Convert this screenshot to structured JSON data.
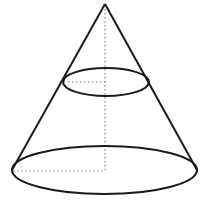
{
  "diagram": {
    "type": "geometry",
    "stroke_color": "#1a1a1a",
    "dotted_color": "#888888",
    "background": "#ffffff",
    "apex": {
      "x": 105,
      "y": 4
    },
    "cross_section": {
      "cx": 106,
      "cy": 82,
      "rx": 43,
      "ry": 14
    },
    "base": {
      "cx": 104.5,
      "cy": 170,
      "rx": 92.5,
      "ry": 24
    },
    "axis": {
      "x": 105,
      "y1": 5,
      "y2": 170
    },
    "cross_section_radius": {
      "x1": 64,
      "x2": 106,
      "y": 82
    },
    "base_radius": {
      "x1": 13,
      "x2": 105,
      "y": 171
    }
  }
}
